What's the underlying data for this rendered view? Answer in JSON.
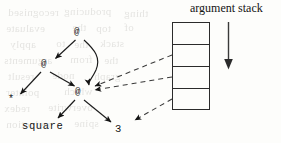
{
  "figure": {
    "kind": "graph-reduction-diagram",
    "caption_title": "argument stack",
    "background": "#fdfdfb",
    "ink": "#141414"
  },
  "stack": {
    "title": "argument stack",
    "cells": 4,
    "x": 172,
    "y": 22,
    "width": 38,
    "height": 88,
    "direction_arrow": {
      "name": "stack-growth-arrow",
      "orientation": "down",
      "x": 228,
      "y1": 22,
      "y2": 68
    }
  },
  "tree": {
    "nodes": [
      {
        "id": "ap-root",
        "label": "@",
        "x": 79,
        "y": 33,
        "kind": "application"
      },
      {
        "id": "ap-left",
        "label": "@",
        "x": 45,
        "y": 65,
        "kind": "application"
      },
      {
        "id": "ap-mid",
        "label": "@",
        "x": 79,
        "y": 93,
        "kind": "application"
      },
      {
        "id": "times",
        "label": "*",
        "x": 12,
        "y": 101,
        "kind": "primitive"
      },
      {
        "id": "square",
        "label": "square",
        "x": 22,
        "y": 128,
        "kind": "identifier"
      },
      {
        "id": "three",
        "label": "3",
        "x": 117,
        "y": 131,
        "kind": "literal"
      }
    ],
    "edges": [
      {
        "from": "ap-root",
        "to": "ap-left",
        "style": "solid",
        "arrow": true
      },
      {
        "from": "ap-root",
        "to": "ap-mid",
        "style": "solid-curved",
        "arrow": true
      },
      {
        "from": "ap-left",
        "to": "times",
        "style": "solid",
        "arrow": true
      },
      {
        "from": "ap-left",
        "to": "ap-mid",
        "style": "solid",
        "arrow": true
      },
      {
        "from": "ap-mid",
        "to": "square",
        "style": "solid",
        "arrow": true
      },
      {
        "from": "ap-mid",
        "to": "three",
        "style": "solid",
        "arrow": true
      }
    ],
    "stack_pointers": [
      {
        "from_cell": 1,
        "to_node": "ap-mid",
        "style": "dashed",
        "arrow": true
      },
      {
        "from_cell": 2,
        "to_node": "ap-mid",
        "style": "dashed",
        "arrow": true
      },
      {
        "from_cell": 3,
        "to_node": "three",
        "style": "dashed",
        "arrow": true
      }
    ]
  },
  "bleed_through": [
    {
      "text": "recognised",
      "x": 8,
      "y": 6,
      "size": 11
    },
    {
      "text": "producing",
      "x": 64,
      "y": 5,
      "size": 11
    },
    {
      "text": "thing",
      "x": 124,
      "y": 7,
      "size": 11
    },
    {
      "text": "evaluate",
      "x": 6,
      "y": 22,
      "size": 11
    },
    {
      "text": "the",
      "x": 72,
      "y": 21,
      "size": 11
    },
    {
      "text": "top",
      "x": 96,
      "y": 22,
      "size": 11
    },
    {
      "text": "of",
      "x": 124,
      "y": 21,
      "size": 11
    },
    {
      "text": "apply",
      "x": 10,
      "y": 38,
      "size": 11
    },
    {
      "text": "to",
      "x": 56,
      "y": 37,
      "size": 11
    },
    {
      "text": "the",
      "x": 74,
      "y": 38,
      "size": 11
    },
    {
      "text": "stack",
      "x": 100,
      "y": 37,
      "size": 11
    },
    {
      "text": "arguments",
      "x": 4,
      "y": 54,
      "size": 11
    },
    {
      "text": "from",
      "x": 70,
      "y": 53,
      "size": 11
    },
    {
      "text": "the",
      "x": 104,
      "y": 54,
      "size": 11
    },
    {
      "text": "result",
      "x": 8,
      "y": 70,
      "size": 11
    },
    {
      "text": "node",
      "x": 52,
      "y": 69,
      "size": 11
    },
    {
      "text": "graph",
      "x": 94,
      "y": 70,
      "size": 11
    },
    {
      "text": "pointer",
      "x": 6,
      "y": 86,
      "size": 11
    },
    {
      "text": "which",
      "x": 64,
      "y": 85,
      "size": 11
    },
    {
      "text": "redex",
      "x": 4,
      "y": 102,
      "size": 11
    },
    {
      "text": "overwrite",
      "x": 48,
      "y": 101,
      "size": 11
    },
    {
      "text": "reduction",
      "x": 6,
      "y": 118,
      "size": 11
    },
    {
      "text": "spine",
      "x": 74,
      "y": 117,
      "size": 11
    }
  ]
}
